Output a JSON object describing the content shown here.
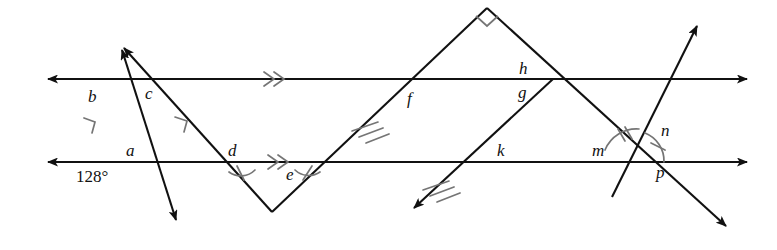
{
  "figure": {
    "background_color": "#ffffff",
    "stroke_color": "#111111",
    "mark_color": "#6b6b6b",
    "width": 777,
    "height": 250
  },
  "labels": {
    "a": "a",
    "b": "b",
    "c": "c",
    "d": "d",
    "e": "e",
    "f": "f",
    "g": "g",
    "h": "h",
    "k": "k",
    "m": "m",
    "n": "n",
    "p": "p",
    "angle_128": "128°"
  },
  "label_positions": [
    {
      "id": "b",
      "text": "b",
      "x": 88,
      "y": 88,
      "kind": "angle-label"
    },
    {
      "id": "c",
      "text": "c",
      "x": 145,
      "y": 85,
      "kind": "angle-label"
    },
    {
      "id": "a",
      "text": "a",
      "x": 126,
      "y": 142,
      "kind": "angle-label"
    },
    {
      "id": "d",
      "text": "d",
      "x": 228,
      "y": 142,
      "kind": "angle-label"
    },
    {
      "id": "e",
      "text": "e",
      "x": 286,
      "y": 168,
      "kind": "angle-label"
    },
    {
      "id": "f",
      "text": "f",
      "x": 407,
      "y": 90,
      "kind": "angle-label"
    },
    {
      "id": "h",
      "text": "h",
      "x": 520,
      "y": 62,
      "kind": "angle-label"
    },
    {
      "id": "g",
      "text": "g",
      "x": 519,
      "y": 86,
      "kind": "angle-label"
    },
    {
      "id": "k",
      "text": "k",
      "x": 497,
      "y": 143,
      "kind": "angle-label"
    },
    {
      "id": "m",
      "text": "m",
      "x": 594,
      "y": 143,
      "kind": "angle-label"
    },
    {
      "id": "n",
      "text": "n",
      "x": 660,
      "y": 124,
      "kind": "angle-label"
    },
    {
      "id": "p",
      "text": "p",
      "x": 656,
      "y": 166,
      "kind": "angle-label"
    },
    {
      "id": "a128",
      "text": "128°",
      "x": 78,
      "y": 166,
      "kind": "angle-measure"
    }
  ],
  "lines": [
    {
      "id": "upper-parallel-line",
      "kind": "horizontal",
      "from": [
        40,
        79
      ],
      "to": [
        755,
        79
      ],
      "arrows": "both",
      "mark": "double-chevron"
    },
    {
      "id": "lower-parallel-line",
      "kind": "horizontal",
      "from": [
        40,
        162
      ],
      "to": [
        755,
        162
      ],
      "arrows": "both",
      "mark": "double-chevron"
    },
    {
      "id": "transversal-left-1",
      "kind": "transversal",
      "from": [
        118,
        42
      ],
      "to": [
        180,
        227
      ],
      "arrows": "both",
      "mark": "single-chevron"
    },
    {
      "id": "transversal-left-2",
      "kind": "transversal",
      "from": [
        128,
        38
      ],
      "to": [
        272,
        212
      ],
      "arrows": "start",
      "mark": "single-chevron"
    },
    {
      "id": "zigzag-up-right",
      "kind": "transversal",
      "from": [
        272,
        212
      ],
      "to": [
        487,
        8
      ],
      "arrows": "none",
      "mark": "triple-tick"
    },
    {
      "id": "zigzag-down-right",
      "kind": "transversal",
      "from": [
        487,
        8
      ],
      "to": [
        730,
        230
      ],
      "arrows": "end",
      "mark": "none"
    },
    {
      "id": "transversal-lower-left-diag",
      "kind": "transversal",
      "from": [
        410,
        212
      ],
      "to": [
        553,
        79
      ],
      "arrows": "start",
      "mark": "triple-tick"
    },
    {
      "id": "transversal-steep-right",
      "kind": "transversal",
      "from": [
        700,
        20
      ],
      "to": [
        610,
        200
      ],
      "arrows": "start",
      "mark": "none"
    }
  ],
  "marks": [
    {
      "id": "right-angle-apex",
      "type": "right-angle-square",
      "at": [
        487,
        8
      ]
    },
    {
      "id": "angle-arc-b",
      "type": "single-tick-arrow",
      "at": [
        93,
        120
      ]
    },
    {
      "id": "angle-arc-c",
      "type": "single-tick-arrow",
      "at": [
        183,
        120
      ]
    },
    {
      "id": "angle-arc-d",
      "type": "single-tick-arc",
      "at": [
        243,
        172
      ]
    },
    {
      "id": "angle-arc-e",
      "type": "single-tick-arc",
      "at": [
        305,
        172
      ]
    },
    {
      "id": "angle-arc-m",
      "type": "double-tick-arc",
      "at": [
        634,
        163
      ]
    },
    {
      "id": "angle-arc-n",
      "type": "single-tick-arc",
      "at": [
        634,
        163
      ]
    }
  ],
  "intersections": [
    {
      "id": "vertex-b",
      "x": 88,
      "y": 79
    },
    {
      "id": "vertex-c",
      "x": 165,
      "y": 79
    },
    {
      "id": "vertex-a",
      "x": 137,
      "y": 162
    },
    {
      "id": "vertex-d",
      "x": 239,
      "y": 162
    },
    {
      "id": "vertex-e",
      "x": 310,
      "y": 162
    },
    {
      "id": "vertex-f",
      "x": 425,
      "y": 79
    },
    {
      "id": "vertex-h-g",
      "x": 553,
      "y": 79
    },
    {
      "id": "vertex-k",
      "x": 480,
      "y": 162
    },
    {
      "id": "vertex-m-n-p",
      "x": 634,
      "y": 163
    },
    {
      "id": "vertex-apex",
      "x": 487,
      "y": 8
    },
    {
      "id": "vertex-v-bottom",
      "x": 272,
      "y": 212
    }
  ]
}
